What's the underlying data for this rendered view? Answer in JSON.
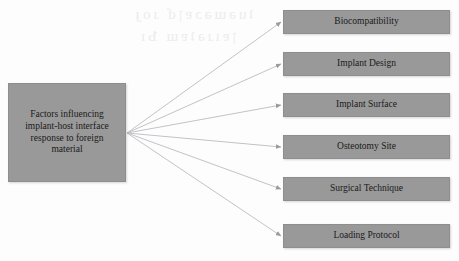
{
  "diagram": {
    "type": "hub-and-spoke-flowchart",
    "background_color": "#fdfdfd",
    "node_fill_color": "#999999",
    "node_text_color": "#1a1a1a",
    "connector_color": "#b9b9bd",
    "root": {
      "label": "Factors influencing implant-host interface response to foreign material",
      "lines": [
        "Factors influencing",
        "implant-host interface",
        "response to foreign",
        "material"
      ]
    },
    "branches": [
      {
        "label": "Biocompatibility"
      },
      {
        "label": "Implant Design"
      },
      {
        "label": "Implant Surface"
      },
      {
        "label": "Osteotomy Site"
      },
      {
        "label": "Surgical Technique"
      },
      {
        "label": "Loading Protocol"
      }
    ],
    "watermark": {
      "line1": "ʇuǝɯǝɔɐןɗ ɹoɟ",
      "line2": "ןɐıɹǝʇɐɯ Ƅı"
    }
  }
}
